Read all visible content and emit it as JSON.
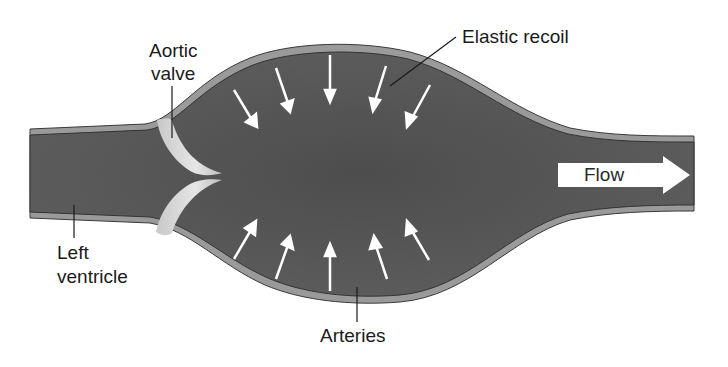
{
  "diagram": {
    "labels": {
      "aortic_valve_line1": "Aortic",
      "aortic_valve_line2": "valve",
      "elastic_recoil": "Elastic recoil",
      "left_ventricle_line1": "Left",
      "left_ventricle_line2": "ventricle",
      "arteries": "Arteries",
      "flow": "Flow"
    },
    "colors": {
      "vessel_fill": "#555555",
      "vessel_wall": "#9a9a9a",
      "wall_line": "#3a3a3a",
      "valve": "#d9d9d9",
      "arrow": "#ffffff",
      "background": "#ffffff"
    },
    "arrows": {
      "top_count": 5,
      "bottom_count": 5,
      "direction": "inward"
    }
  }
}
